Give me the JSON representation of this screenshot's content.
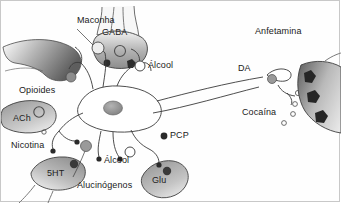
{
  "figure": {
    "domain": "Diagram",
    "background_color": "#ffffff",
    "border_color": "#c8c8c8"
  },
  "palette": {
    "outline": "#3a3a3a",
    "terminal_gray_light": "#d8d8d8",
    "terminal_gray_mid": "#a9a9a9",
    "terminal_gray_dark": "#6e6e6e",
    "receptor_dark": "#2b2b2b",
    "receptor_mid": "#8a8a8a",
    "receptor_open": "#ffffff",
    "soma_fill": "#ffffff",
    "nucleus_fill": "#9b9b9b",
    "text": "#1a1a1a"
  },
  "labels": {
    "maconha": "Maconha",
    "gaba": "GABA",
    "anfetamina": "Anfetamina",
    "alcool_upper": "Álcool",
    "opioides": "Opioides",
    "da": "DA",
    "ach": "ACh",
    "cocaina": "Cocaína",
    "nicotina": "Nicotina",
    "pcp": "PCP",
    "alcool_lower": "Álcool",
    "5ht": "5HT",
    "glu": "Glu",
    "alucinogenos": "Alucinógenos"
  },
  "neurotransmitter_terminals": [
    {
      "name": "GABA",
      "label": "GABA",
      "position": "top-center",
      "receptor_marker": "open-circle"
    },
    {
      "name": "ACh",
      "label": "ACh",
      "position": "left-middle",
      "receptor_marker": "open-circle"
    },
    {
      "name": "5HT",
      "label": "5HT",
      "position": "bottom-left",
      "receptor_marker": "filled-circle"
    },
    {
      "name": "Glu",
      "label": "Glu",
      "position": "bottom-right",
      "receptor_marker": "filled-circle"
    },
    {
      "name": "DA",
      "label": "DA",
      "position": "right-synapse",
      "receptor_marker": "filled-circle"
    }
  ],
  "drug_annotations": [
    {
      "label": "Maconha",
      "marker": "light-circle",
      "target": "presynaptic-terminal"
    },
    {
      "label": "Álcool",
      "marker": "open-circle",
      "target": "receptor-upper"
    },
    {
      "label": "Opioides",
      "marker": "filled-circle",
      "target": "receptor-left"
    },
    {
      "label": "Nicotina",
      "marker": "small-circle",
      "target": "ach-receptor"
    },
    {
      "label": "Alucinógenos",
      "marker": "gray-circle",
      "target": "dendrite-receptor"
    },
    {
      "label": "Álcool",
      "marker": "open-circle",
      "target": "receptor-lower"
    },
    {
      "label": "PCP",
      "marker": "small-dot",
      "target": "nmda-receptor"
    },
    {
      "label": "Anfetamina",
      "marker": "none",
      "target": "dopamine-terminal"
    },
    {
      "label": "Cocaína",
      "marker": "none",
      "target": "dopamine-transporter"
    }
  ]
}
